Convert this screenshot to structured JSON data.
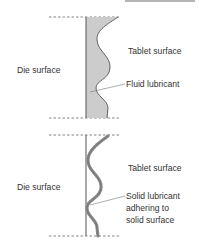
{
  "colors": {
    "line": "#555555",
    "fill": "#cccccc",
    "bead": "#888888",
    "text": "#333333",
    "topbar": "#b5b5b5"
  },
  "top_panel": {
    "left_label": "Die surface",
    "right_label": "Tablet surface",
    "callout_label": "Fluid lubricant"
  },
  "bottom_panel": {
    "left_label": "Die surface",
    "right_label": "Tablet surface",
    "callout_lines": [
      "Solid lubricant",
      "adhering to",
      "solid surface"
    ]
  }
}
